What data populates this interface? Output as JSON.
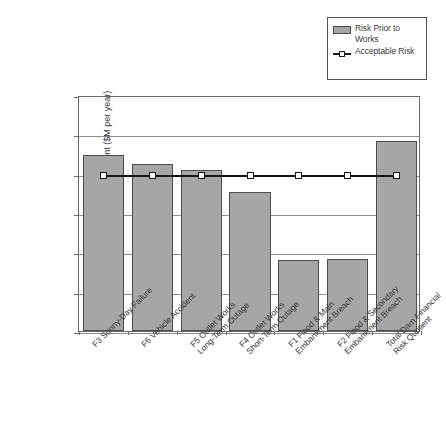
{
  "chart_data": {
    "type": "bar",
    "title": "",
    "xlabel": "",
    "ylabel": "Risk Quotient ($M per year)",
    "y_scale": "log",
    "ylim": [
      1e-06,
      1
    ],
    "grid": true,
    "legend_position": "top-right",
    "y_tick_labels": [
      "1.E+00",
      "1.E-01",
      "1.E-02",
      "1.E-03",
      "1.E-04",
      "1.E-05",
      "1.E-06"
    ],
    "y_tick_values": [
      1,
      0.1,
      0.01,
      0.001,
      0.0001,
      1e-05,
      1e-06
    ],
    "categories": [
      "F3 Sunny-Day Failure",
      "F6 Vehicle Accident",
      "F5 Outlet Works Long-Term Outage",
      "F4 Outlet Works Short-Term Outage",
      "F1 Flood & Main Embankment Breach",
      "F2 Flood & Secondary Embankment Breach",
      "Total Dam Financial Risk Quotient"
    ],
    "category_lines": [
      [
        "F3 Sunny-Day Failure"
      ],
      [
        "F6 Vehicle Accident"
      ],
      [
        "F5 Outlet Works",
        "Long-Term Outage"
      ],
      [
        "F4 Outlet Works",
        "Short-Term Outage"
      ],
      [
        "F1 Flood & Main",
        "Embankment Breach"
      ],
      [
        "F2 Flood & Secondary",
        "Embankment Breach"
      ],
      [
        "Total Dam Financial",
        "Risk Quotient"
      ]
    ],
    "series": [
      {
        "name": "Risk Prior to Works",
        "kind": "bar",
        "color": "#a6a6a6",
        "border_color": "#4d4d4d",
        "values": [
          0.0305,
          0.0175,
          0.0125,
          0.0035,
          6.5e-05,
          6.6e-05,
          0.069
        ]
      },
      {
        "name": "Acceptable Risk",
        "kind": "line",
        "color": "#141414",
        "marker": "square-open",
        "values": [
          0.01,
          0.01,
          0.01,
          0.01,
          0.01,
          0.01,
          0.01
        ]
      }
    ]
  },
  "legend": {
    "entries": [
      {
        "label": "Risk Prior to Works",
        "type": "bar-swatch"
      },
      {
        "label": "Acceptable Risk",
        "type": "line-swatch"
      }
    ]
  },
  "caption": ""
}
